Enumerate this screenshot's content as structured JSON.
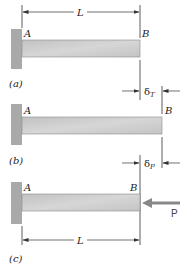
{
  "figure": {
    "panels": [
      {
        "id": "a",
        "caption": "(a)",
        "point_left": "A",
        "point_right": "B",
        "dimension_label": "L"
      },
      {
        "id": "b",
        "caption": "(b)",
        "point_left": "A",
        "point_right": "B",
        "delta_label": "δ",
        "delta_sub": "T"
      },
      {
        "id": "c",
        "caption": "(c)",
        "point_left": "A",
        "point_right": "B",
        "delta_label": "δ",
        "delta_sub": "P",
        "force_label": "P",
        "dimension_label": "L"
      }
    ],
    "colors": {
      "wall": "#a9a9a9",
      "beam": "#cbcbcb",
      "beam_edge": "#8a8a8a",
      "line": "#333333",
      "force_arrow": "#888888"
    }
  }
}
